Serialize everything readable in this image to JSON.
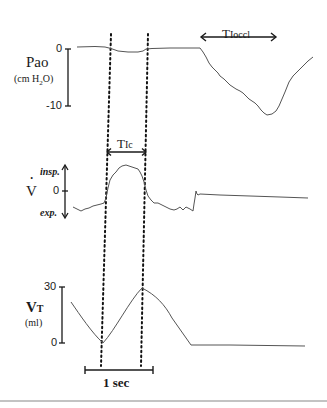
{
  "figure": {
    "panels": {
      "pao": {
        "label": "Pao",
        "unit_prefix": "(cm H",
        "unit_sub": "2",
        "unit_suffix": "O)",
        "tick_top": "0",
        "tick_bottom": "-10"
      },
      "flow": {
        "label": "V",
        "label_dot": "·",
        "tick_zero": "0",
        "insp_label": "insp.",
        "exp_label": "exp."
      },
      "volume": {
        "label_main": "V",
        "label_sub": "T",
        "unit": "(ml)",
        "tick_top": "30",
        "tick_bottom": "0"
      }
    },
    "annotations": {
      "ti_occl_main": "T",
      "ti_occl_sub": "Ioccl",
      "ti_c_main": "T",
      "ti_c_sub": "Ic",
      "time_scale": "1 sec"
    },
    "colors": {
      "trace": "#555555",
      "axis": "#1a1a1a",
      "dotted": "#111111",
      "rule": "#888888"
    }
  }
}
